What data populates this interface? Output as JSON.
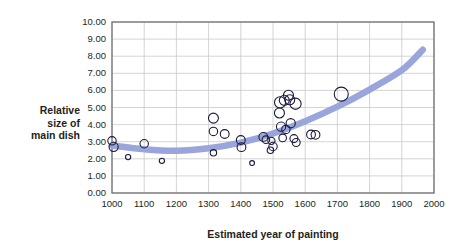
{
  "chart_data": {
    "type": "scatter",
    "title": "",
    "xlabel": "Estimated year of painting",
    "ylabel": "Relative size of main dish",
    "ylabel_lines": [
      "Relative",
      "size of",
      "main dish"
    ],
    "xlim": [
      1000,
      2000
    ],
    "ylim": [
      0.0,
      10.0
    ],
    "xticks": [
      1000,
      1100,
      1200,
      1300,
      1400,
      1500,
      1600,
      1700,
      1800,
      1900,
      2000
    ],
    "xtick_labels": [
      "1000",
      "1100",
      "1200",
      "1300",
      "1400",
      "1500",
      "1600",
      "1700",
      "1800",
      "1900",
      "2000"
    ],
    "yticks": [
      0.0,
      1.0,
      2.0,
      3.0,
      4.0,
      5.0,
      6.0,
      7.0,
      8.0,
      9.0,
      10.0
    ],
    "ytick_labels": [
      "0.00",
      "1.00",
      "2.00",
      "3.00",
      "4.00",
      "5.00",
      "6.00",
      "7.00",
      "8.00",
      "9.00",
      "10.00"
    ],
    "grid": true,
    "grid_color": "#c9c9c9",
    "axis_color": "#7a7a7a",
    "marker_style": "open-circle",
    "marker_edge_color": "#1b1b3a",
    "marker_fill": "none",
    "points": [
      {
        "x": 1000,
        "y": 3.05,
        "r": 4.2
      },
      {
        "x": 1005,
        "y": 2.7,
        "r": 4.6
      },
      {
        "x": 1050,
        "y": 2.1,
        "r": 2.6
      },
      {
        "x": 1100,
        "y": 2.88,
        "r": 4.2
      },
      {
        "x": 1155,
        "y": 1.88,
        "r": 2.6
      },
      {
        "x": 1315,
        "y": 4.38,
        "r": 5.0
      },
      {
        "x": 1315,
        "y": 3.6,
        "r": 4.2
      },
      {
        "x": 1350,
        "y": 3.45,
        "r": 4.4
      },
      {
        "x": 1315,
        "y": 2.35,
        "r": 3.2
      },
      {
        "x": 1400,
        "y": 3.1,
        "r": 4.4
      },
      {
        "x": 1402,
        "y": 2.68,
        "r": 4.4
      },
      {
        "x": 1435,
        "y": 1.75,
        "r": 2.4
      },
      {
        "x": 1470,
        "y": 3.28,
        "r": 4.4
      },
      {
        "x": 1478,
        "y": 3.12,
        "r": 3.8
      },
      {
        "x": 1495,
        "y": 3.05,
        "r": 3.6
      },
      {
        "x": 1492,
        "y": 2.5,
        "r": 3.2
      },
      {
        "x": 1500,
        "y": 2.72,
        "r": 4.2
      },
      {
        "x": 1520,
        "y": 4.68,
        "r": 5.0
      },
      {
        "x": 1522,
        "y": 5.3,
        "r": 5.6
      },
      {
        "x": 1535,
        "y": 5.42,
        "r": 5.0
      },
      {
        "x": 1548,
        "y": 5.72,
        "r": 5.0
      },
      {
        "x": 1552,
        "y": 5.45,
        "r": 5.0
      },
      {
        "x": 1570,
        "y": 5.22,
        "r": 5.6
      },
      {
        "x": 1525,
        "y": 3.88,
        "r": 4.6
      },
      {
        "x": 1540,
        "y": 3.72,
        "r": 4.2
      },
      {
        "x": 1555,
        "y": 4.08,
        "r": 4.6
      },
      {
        "x": 1530,
        "y": 3.22,
        "r": 3.8
      },
      {
        "x": 1565,
        "y": 3.18,
        "r": 4.0
      },
      {
        "x": 1572,
        "y": 2.95,
        "r": 4.0
      },
      {
        "x": 1618,
        "y": 3.42,
        "r": 4.4
      },
      {
        "x": 1632,
        "y": 3.4,
        "r": 4.4
      },
      {
        "x": 1712,
        "y": 5.78,
        "r": 7.0
      }
    ],
    "trend": {
      "style": "smooth-curve",
      "color": "#9aa5dc",
      "width": 6.5,
      "points": [
        {
          "x": 1000,
          "y": 2.78
        },
        {
          "x": 1100,
          "y": 2.56
        },
        {
          "x": 1200,
          "y": 2.47
        },
        {
          "x": 1300,
          "y": 2.62
        },
        {
          "x": 1400,
          "y": 2.95
        },
        {
          "x": 1500,
          "y": 3.48
        },
        {
          "x": 1600,
          "y": 4.2
        },
        {
          "x": 1700,
          "y": 5.05
        },
        {
          "x": 1800,
          "y": 6.05
        },
        {
          "x": 1900,
          "y": 7.18
        },
        {
          "x": 1965,
          "y": 8.38
        }
      ]
    }
  }
}
